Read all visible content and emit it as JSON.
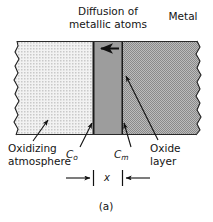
{
  "figure": {
    "caption": "(a)",
    "width": 213,
    "height": 222
  },
  "annotations": {
    "title_diffusion": "Diffusion of\nmetallic atoms",
    "metal": "Metal",
    "oxidizing_atmosphere": "Oxidizing\natmosphere",
    "oxide_layer": "Oxide\nlayer",
    "concentration_oxide_side": "C",
    "concentration_oxide_side_subscript": "o",
    "concentration_metal_side": "C",
    "concentration_metal_side_subscript": "m",
    "thickness_symbol": "x"
  },
  "regions": [
    {
      "name": "oxidizing-atmosphere",
      "fill": "#e8e8e8",
      "texture": "fine-dot-stipple",
      "x_from": 13,
      "x_to": 93
    },
    {
      "name": "oxide-layer",
      "fill": "#9d9d9d",
      "texture": "solid",
      "x_from": 93,
      "x_to": 123
    },
    {
      "name": "metal",
      "fill": "#a6a6a6",
      "texture": "checker-stipple",
      "x_from": 123,
      "x_to": 200
    }
  ],
  "colors": {
    "outline": "#1a1a1a",
    "atmosphere_fill": "#ebebeb",
    "oxide_fill": "#9d9d9d",
    "metal_fill": "#a8a8a8",
    "text": "#141414",
    "background": "#ffffff"
  },
  "arrows": {
    "diffusion_direction": "left",
    "diffusion_arrow_label": "metallic atoms diffusing toward oxidizing atmosphere"
  }
}
